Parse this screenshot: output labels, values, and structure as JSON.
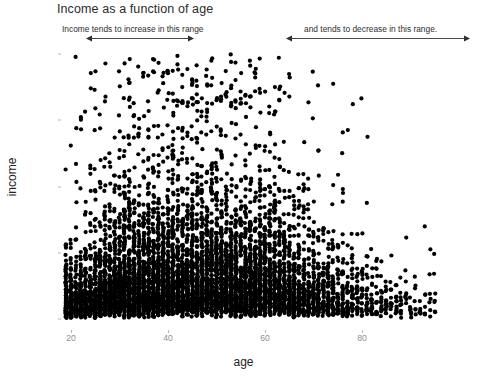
{
  "title": "Income as a function of age",
  "annotations": {
    "left_label": "Income tends to increase in this range",
    "right_label": "and tends to decrease in this range.",
    "panel_note_line1": "But the relationship",
    "panel_note_line2": "is hard to see."
  },
  "axes": {
    "x_title": "age",
    "y_title": "income",
    "x_ticks": [
      "20",
      "40",
      "60",
      "80"
    ],
    "y_ticks": [
      "0",
      "50000",
      "100000",
      "150000",
      "200000"
    ]
  },
  "colors": {
    "point": "#000000",
    "background": "#ffffff",
    "panel": "#ffffff",
    "tick_label": "#8e8e8e",
    "axis_title": "#242424",
    "title": "#2b2b2b",
    "annotation": "#2e2e2e",
    "arrow": "#4a4a4a"
  },
  "chart_data": {
    "type": "scatter",
    "title": "Income as a function of age",
    "xlabel": "age",
    "ylabel": "income",
    "xlim": [
      17,
      97
    ],
    "ylim": [
      -4000,
      212000
    ],
    "x_ticks": [
      20,
      40,
      60,
      80
    ],
    "y_ticks": [
      0,
      50000,
      100000,
      150000,
      200000
    ],
    "grid": false,
    "legend": "none",
    "point_color": "#000000",
    "point_radius_px": 2.1,
    "n_points": 6400,
    "overplotted": true,
    "age_distribution": {
      "min": 19,
      "max": 95,
      "peak_start": 26,
      "peak_end": 62,
      "counts_by_age_band": [
        {
          "band": "19-24",
          "weight": 0.55
        },
        {
          "band": "25-34",
          "weight": 1.0
        },
        {
          "band": "35-44",
          "weight": 1.0
        },
        {
          "band": "45-54",
          "weight": 0.95
        },
        {
          "band": "55-64",
          "weight": 0.85
        },
        {
          "band": "65-74",
          "weight": 0.42
        },
        {
          "band": "75-84",
          "weight": 0.16
        },
        {
          "band": "85-95",
          "weight": 0.05
        }
      ]
    },
    "income_distribution": {
      "shape": "right-skewed",
      "median_approx": 22000,
      "cap": 200000,
      "median_by_age": [
        {
          "age": 20,
          "median_income": 12000
        },
        {
          "age": 30,
          "median_income": 24000
        },
        {
          "age": 40,
          "median_income": 30000
        },
        {
          "age": 50,
          "median_income": 31000
        },
        {
          "age": 60,
          "median_income": 28000
        },
        {
          "age": 70,
          "median_income": 20000
        },
        {
          "age": 80,
          "median_income": 14000
        },
        {
          "age": 90,
          "median_income": 11000
        }
      ]
    },
    "annotations": [
      {
        "text": "Income tends to increase in this range",
        "x_range": [
          23,
          46
        ],
        "position": "above-panel-left"
      },
      {
        "text": "and tends to decrease in this range.",
        "x_range": [
          64,
          95
        ],
        "position": "above-panel-right"
      },
      {
        "text": "But the relationship is hard to see.",
        "x": 80,
        "y": 140000,
        "position": "in-panel-upper-right"
      }
    ]
  }
}
